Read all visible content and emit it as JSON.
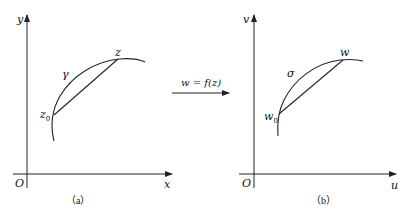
{
  "panel_a": {
    "y_axis_label": "y",
    "x_axis_label": "x",
    "origin_label": "O",
    "curve_label": "γ",
    "start_point_label": "z",
    "start_point_subscript": "0",
    "end_point_label": "z",
    "caption": "（a）"
  },
  "mapping": {
    "label": "w = f(z)"
  },
  "panel_b": {
    "y_axis_label": "v",
    "x_axis_label": "u",
    "origin_label": "O",
    "curve_label": "σ",
    "start_point_label": "w",
    "start_point_subscript": "0",
    "end_point_label": "w",
    "caption": "（b）"
  },
  "colors": {
    "stroke": "#222222",
    "background": "#ffffff"
  }
}
